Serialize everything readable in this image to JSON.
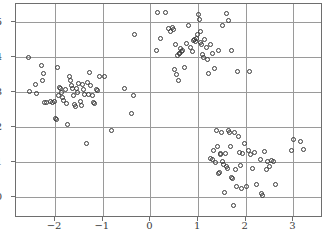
{
  "chart_data": {
    "type": "scatter",
    "title": "",
    "subtitle": "",
    "xlabel": "",
    "ylabel": "",
    "xlim": [
      -2.82,
      3.62
    ],
    "ylim": [
      -0.61,
      5.5
    ],
    "grid": true,
    "legend": null,
    "marker": "open-circle",
    "marker_color": "#3a3a3a",
    "xticks": [
      -2,
      -1,
      0,
      1,
      2,
      3
    ],
    "xticklabels": [
      "−2",
      "−1",
      "0",
      "1",
      "2",
      "3"
    ],
    "yticks": [
      0,
      1,
      2,
      3,
      4,
      5
    ],
    "yticklabels": [
      "0",
      "1",
      "2",
      "3",
      "4",
      "5"
    ],
    "series": [
      {
        "name": "cluster-left",
        "points": [
          [
            -2.56,
            3.96
          ],
          [
            -2.53,
            3.01
          ],
          [
            -2.42,
            3.21
          ],
          [
            -2.38,
            2.95
          ],
          [
            -2.28,
            3.75
          ],
          [
            -2.27,
            3.32
          ],
          [
            -2.24,
            3.52
          ],
          [
            -2.22,
            2.69
          ],
          [
            -2.18,
            2.68
          ],
          [
            -2.1,
            2.72
          ],
          [
            -2.05,
            2.7
          ],
          [
            -2.02,
            2.73
          ],
          [
            -1.99,
            2.24
          ],
          [
            -1.97,
            2.19
          ],
          [
            -1.95,
            3.68
          ],
          [
            -1.93,
            2.9
          ],
          [
            -1.9,
            3.13
          ],
          [
            -1.88,
            3.1
          ],
          [
            -1.86,
            2.96
          ],
          [
            -1.84,
            2.83
          ],
          [
            -1.82,
            2.75
          ],
          [
            -1.79,
            3.05
          ],
          [
            -1.76,
            2.66
          ],
          [
            -1.73,
            2.07
          ],
          [
            -1.7,
            3.43
          ],
          [
            -1.68,
            3.32
          ],
          [
            -1.66,
            3.16
          ],
          [
            -1.64,
            3.08
          ],
          [
            -1.62,
            2.88
          ],
          [
            -1.6,
            2.62
          ],
          [
            -1.58,
            2.56
          ],
          [
            -1.55,
            3.1
          ],
          [
            -1.52,
            2.98
          ],
          [
            -1.5,
            3.22
          ],
          [
            -1.47,
            2.73
          ],
          [
            -1.45,
            2.6
          ],
          [
            -1.42,
            3.19
          ],
          [
            -1.4,
            3.07
          ],
          [
            -1.38,
            2.93
          ],
          [
            -1.35,
            1.53
          ],
          [
            -1.33,
            3.25
          ],
          [
            -1.3,
            2.91
          ],
          [
            -1.27,
            3.55
          ],
          [
            -1.25,
            3.18
          ],
          [
            -1.22,
            2.88
          ],
          [
            -1.2,
            2.7
          ],
          [
            -1.17,
            2.66
          ],
          [
            -1.13,
            3.05
          ],
          [
            -1.1,
            3.02
          ],
          [
            -1.06,
            3.42
          ],
          [
            -0.96,
            3.43
          ],
          [
            -0.82,
            1.88
          ],
          [
            -0.55,
            3.09
          ],
          [
            -0.4,
            2.38
          ],
          [
            -0.36,
            2.9
          ],
          [
            -0.33,
            4.62
          ]
        ]
      },
      {
        "name": "cluster-top",
        "points": [
          [
            0.12,
            4.18
          ],
          [
            0.14,
            5.27
          ],
          [
            0.22,
            4.52
          ],
          [
            0.32,
            5.25
          ],
          [
            0.38,
            4.79
          ],
          [
            0.42,
            4.72
          ],
          [
            0.46,
            4.84
          ],
          [
            0.48,
            4.78
          ],
          [
            0.5,
            3.62
          ],
          [
            0.52,
            4.33
          ],
          [
            0.55,
            3.5
          ],
          [
            0.57,
            4.03
          ],
          [
            0.58,
            3.32
          ],
          [
            0.6,
            4.1
          ],
          [
            0.62,
            4.08
          ],
          [
            0.64,
            4.22
          ],
          [
            0.66,
            4.13
          ],
          [
            0.68,
            4.18
          ],
          [
            0.72,
            3.7
          ],
          [
            0.76,
            4.37
          ],
          [
            0.8,
            4.9
          ],
          [
            0.84,
            4.25
          ],
          [
            0.88,
            4.14
          ],
          [
            0.9,
            4.45
          ],
          [
            0.93,
            4.48
          ],
          [
            0.95,
            4.42
          ],
          [
            0.97,
            4.52
          ],
          [
            0.99,
            4.64
          ],
          [
            1.0,
            5.19
          ],
          [
            1.02,
            5.05
          ],
          [
            1.04,
            4.72
          ],
          [
            1.06,
            4.4
          ],
          [
            1.08,
            4.34
          ],
          [
            1.1,
            4.05
          ],
          [
            1.12,
            3.96
          ],
          [
            1.14,
            4.49
          ],
          [
            1.18,
            4.26
          ],
          [
            1.2,
            3.91
          ],
          [
            1.22,
            3.52
          ],
          [
            1.26,
            4.35
          ],
          [
            1.3,
            4.08
          ],
          [
            1.34,
            3.67
          ],
          [
            1.42,
            4.18
          ],
          [
            1.52,
            4.88
          ],
          [
            1.6,
            5.22
          ],
          [
            1.64,
            5.02
          ],
          [
            1.7,
            4.18
          ],
          [
            1.82,
            3.58
          ],
          [
            2.08,
            3.56
          ]
        ]
      },
      {
        "name": "cluster-right",
        "points": [
          [
            1.26,
            1.1
          ],
          [
            1.3,
            1.05
          ],
          [
            1.33,
            1.32
          ],
          [
            1.36,
            0.98
          ],
          [
            1.38,
            1.88
          ],
          [
            1.4,
            1.43
          ],
          [
            1.42,
            0.66
          ],
          [
            1.44,
            0.7
          ],
          [
            1.46,
            1.2
          ],
          [
            1.48,
            1.24
          ],
          [
            1.5,
            1.82
          ],
          [
            1.52,
            1.0
          ],
          [
            1.54,
            0.92
          ],
          [
            1.56,
            0.12
          ],
          [
            1.58,
            1.22
          ],
          [
            1.6,
            0.85
          ],
          [
            1.62,
            0.8
          ],
          [
            1.64,
            1.9
          ],
          [
            1.66,
            1.84
          ],
          [
            1.68,
            1.44
          ],
          [
            1.7,
            0.56
          ],
          [
            1.72,
            0.52
          ],
          [
            1.74,
            -0.26
          ],
          [
            1.76,
            1.83
          ],
          [
            1.78,
            0.78
          ],
          [
            1.8,
            0.3
          ],
          [
            1.84,
            1.73
          ],
          [
            1.86,
            1.25
          ],
          [
            1.88,
            0.88
          ],
          [
            1.9,
            0.22
          ],
          [
            1.94,
            1.22
          ],
          [
            1.98,
            1.52
          ],
          [
            2.02,
            0.28
          ],
          [
            2.06,
            1.31
          ],
          [
            2.1,
            1.2
          ],
          [
            2.14,
            0.8
          ],
          [
            2.18,
            1.27
          ],
          [
            2.22,
            0.34
          ],
          [
            2.3,
            1.05
          ],
          [
            2.34,
            0.08
          ],
          [
            2.36,
            0.04
          ],
          [
            2.4,
            1.28
          ],
          [
            2.44,
            0.78
          ],
          [
            2.46,
            1.0
          ],
          [
            2.5,
            0.85
          ],
          [
            2.54,
            1.04
          ],
          [
            2.58,
            1.0
          ],
          [
            2.62,
            0.35
          ],
          [
            2.96,
            1.33
          ],
          [
            3.0,
            1.62
          ],
          [
            3.14,
            1.58
          ],
          [
            3.22,
            1.36
          ]
        ]
      }
    ]
  }
}
